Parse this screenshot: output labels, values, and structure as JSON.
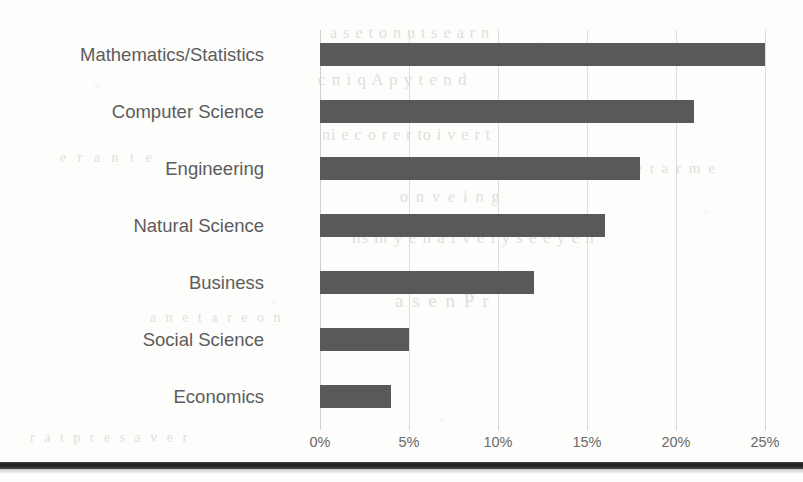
{
  "chart_data": {
    "type": "bar",
    "orientation": "horizontal",
    "title": "",
    "xlabel": "",
    "ylabel": "",
    "categories": [
      "Mathematics/Statistics",
      "Computer Science",
      "Engineering",
      "Natural Science",
      "Business",
      "Social Science",
      "Economics"
    ],
    "values": [
      25,
      21,
      18,
      16,
      12,
      5,
      4
    ],
    "value_unit": "%",
    "xlim": [
      0,
      25
    ],
    "xticks": [
      0,
      5,
      10,
      15,
      20,
      25
    ],
    "xtick_labels": [
      "0%",
      "5%",
      "10%",
      "15%",
      "20%",
      "25%"
    ],
    "grid": true,
    "grid_axis": "x",
    "legend": false,
    "legend_position": "none",
    "bar_color": "#595959",
    "label_color": "#5c5c5c",
    "tick_color": "#6a6a6a",
    "gridline_color": "#dededc",
    "background_color": "#fdfdfc"
  },
  "page": {
    "bleed_through_text": [
      "a  s e  t  o  n  u  t s  e  a  r  n",
      "c  n i  q  A  p  y  t  e  n  d",
      "ni  e  c  o  r  e  r  to  i  v  e  r  t",
      "o  n  v  e  i  n  g",
      "ns  m  y  e  n  a  i  v  e  l  y  s  e  e  y  e  n",
      "a  s e  n  P  r",
      "r  a   t  p  r  e  s  a  v  e  r",
      "a  n   e   t  a  r   e   o  n",
      "n  e  t  a  r  m  e",
      "e   r  a  n  t  e"
    ],
    "bottom_rule_color": "#1e1c1b"
  }
}
